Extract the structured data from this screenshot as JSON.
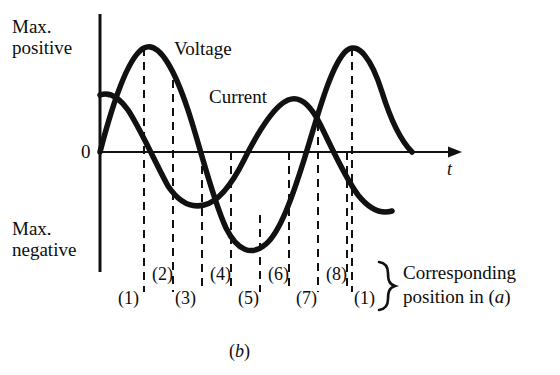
{
  "figure": {
    "caption": "(b)",
    "axis": {
      "y_top_label_line1": "Max.",
      "y_top_label_line2": "positive",
      "y_bottom_label_line1": "Max.",
      "y_bottom_label_line2": "negative",
      "origin_label": "0",
      "x_axis_label": "t"
    },
    "curves": [
      {
        "name": "Voltage",
        "label": "Voltage",
        "color": "#000000",
        "phase_deg": 0,
        "description": "sine wave starting at zero rising to max positive"
      },
      {
        "name": "Current",
        "label": "Current",
        "color": "#000000",
        "phase_deg": -45,
        "description": "sine wave lagging the voltage, starting partway up and falling"
      }
    ],
    "marker_labels_upper": [
      "(2)",
      "(4)",
      "(6)",
      "(8)"
    ],
    "marker_labels_lower": [
      "(1)",
      "(3)",
      "(5)",
      "(7)",
      "(1)"
    ],
    "annotation_line1": "Corresponding",
    "annotation_line2": "position in (a)",
    "annotation_italic_token": "a",
    "brace_glyph": "}"
  },
  "chart_data": {
    "type": "line",
    "title": "",
    "xlabel": "t",
    "ylabel": "",
    "grid": false,
    "legend": "inline-labels",
    "ylim": [
      -1,
      1
    ],
    "ytick_labels": [
      "Max. positive",
      "0",
      "Max. negative"
    ],
    "series": [
      {
        "name": "Voltage",
        "expression": "sin(x)",
        "amplitude": 1.0,
        "phase_deg": 0,
        "cycles": 2,
        "key_points": [
          {
            "marker": "(1)",
            "x_px": 100,
            "value": 0.0
          },
          {
            "marker": "(2)",
            "x_px": 144,
            "value": 1.0
          },
          {
            "marker": "(3)",
            "x_px": 173,
            "value": 0.66
          },
          {
            "marker": "(4)",
            "x_px": 202,
            "value": 0.0
          },
          {
            "marker": "(5)",
            "x_px": 231,
            "value": -0.66
          },
          {
            "marker": "(6)",
            "x_px": 260,
            "value": -1.0
          },
          {
            "marker": "(7)",
            "x_px": 289,
            "value": -0.66
          },
          {
            "marker": "(8)",
            "x_px": 318,
            "value": 0.0
          },
          {
            "marker": "(1)",
            "x_px": 352,
            "value": 1.0
          }
        ]
      },
      {
        "name": "Current",
        "expression": "sin(x - 45deg)",
        "amplitude": 0.55,
        "phase_deg": -45,
        "cycles": 2,
        "key_points": [
          {
            "marker": "(1)",
            "x_px": 100,
            "value": 0.55
          },
          {
            "marker": "(2)",
            "x_px": 144,
            "value": 0.22
          },
          {
            "marker": "(3)",
            "x_px": 173,
            "value": -0.12
          },
          {
            "marker": "(4)",
            "x_px": 202,
            "value": -0.52
          },
          {
            "marker": "(5)",
            "x_px": 231,
            "value": -0.3
          },
          {
            "marker": "(6)",
            "x_px": 260,
            "value": 0.1
          },
          {
            "marker": "(7)",
            "x_px": 289,
            "value": 0.5
          },
          {
            "marker": "(8)",
            "x_px": 318,
            "value": 0.3
          },
          {
            "marker": "(1)",
            "x_px": 352,
            "value": -0.2
          }
        ]
      }
    ],
    "marker_x_positions_px": [
      100,
      144,
      173,
      202,
      231,
      260,
      289,
      318,
      352
    ],
    "zero_line_y_px": 152
  }
}
